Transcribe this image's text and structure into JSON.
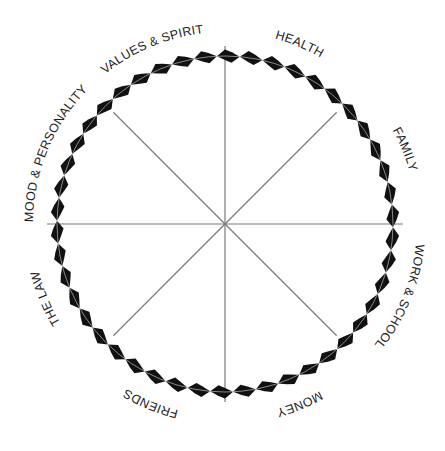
{
  "diagram": {
    "type": "life-areas wheel",
    "center": {
      "x": 225,
      "y": 224
    },
    "ring": {
      "radius": 168,
      "segments": 46,
      "segment_color": "#111111",
      "thread_color": "#d8d8d8"
    },
    "spokes": {
      "count": 8,
      "inner_length": 158,
      "color": "#7a7a7a"
    },
    "label_radius": 192,
    "sections": [
      {
        "label": "HEALTH",
        "angle_deg": -67.5
      },
      {
        "label": "FAMILY",
        "angle_deg": -22.5
      },
      {
        "label": "WORK & SCHOOL",
        "angle_deg": 22.5
      },
      {
        "label": "MONEY",
        "angle_deg": 67.5
      },
      {
        "label": "FRIENDS",
        "angle_deg": 112.5
      },
      {
        "label": "THE LAW",
        "angle_deg": 157.5
      },
      {
        "label": "MOOD & PERSONALITY",
        "angle_deg": 202.5
      },
      {
        "label": "VALUES & SPIRIT",
        "angle_deg": 247.5
      }
    ]
  }
}
